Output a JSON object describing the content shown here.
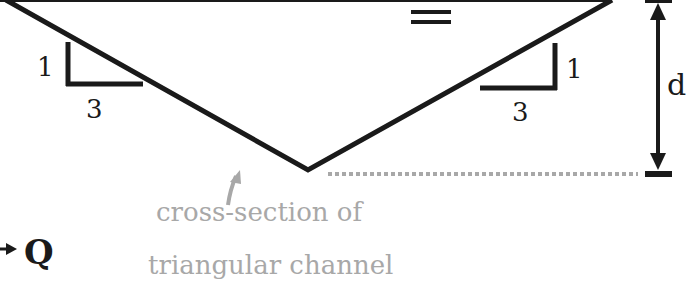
{
  "diagram": {
    "colors": {
      "outline": "#1a1a1a",
      "annotation": "#a8a8a8",
      "background": "#ffffff"
    },
    "water_surface_symbol": "=",
    "left_slope": {
      "rise": "1",
      "run": "3"
    },
    "right_slope": {
      "rise": "1",
      "run": "3"
    },
    "depth_label": "d",
    "flow_label": "Q",
    "annotation": {
      "line1": "cross-section of",
      "line2": "triangular channel"
    }
  }
}
